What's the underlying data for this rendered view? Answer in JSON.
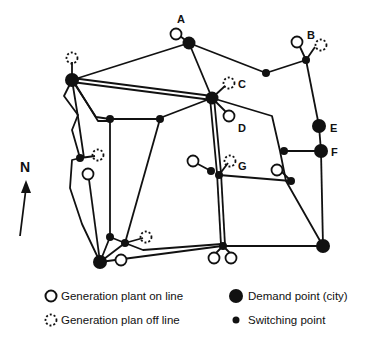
{
  "diagram": {
    "title": "",
    "north_label": "N",
    "node_labels": {
      "A": "A",
      "B": "B",
      "C": "C",
      "D": "D",
      "E": "E",
      "F": "F",
      "G": "G"
    }
  },
  "legend": {
    "gen_on": "Generation plant  on line",
    "gen_off": "Generation plan off line",
    "demand": "Demand point (city)",
    "switching": "Switching point"
  },
  "colors": {
    "line": "#111111",
    "background": "#ffffff"
  }
}
